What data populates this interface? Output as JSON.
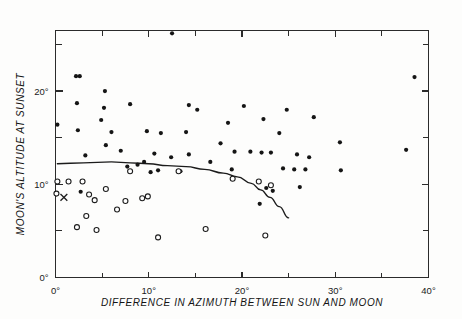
{
  "chart_data": {
    "type": "scatter",
    "title": "",
    "xlabel": "DIFFERENCE IN AZIMUTH BETWEEN SUN AND MOON",
    "ylabel": "MOON'S ALTITUDE AT SUNSET",
    "xlim": [
      0,
      40
    ],
    "ylim": [
      0,
      26.5
    ],
    "grid": false,
    "legend_position": "none",
    "x_major_ticks": [
      0,
      10,
      20,
      30,
      40
    ],
    "x_minor_ticks": [
      5,
      15,
      25,
      35
    ],
    "x_tick_labels": [
      "0°",
      "10°",
      "20°",
      "30°",
      "40°"
    ],
    "y_major_ticks": [
      0,
      10,
      20
    ],
    "y_minor_ticks": [
      5,
      15,
      25
    ],
    "y_tick_labels": [
      "0°",
      "10°",
      "20°"
    ],
    "x_unit": "degrees",
    "y_unit": "degrees",
    "series": [
      {
        "name": "filled-circles",
        "marker": "filled-circle",
        "color": "#151515",
        "points": [
          [
            12.5,
            26.2
          ],
          [
            2.2,
            21.6
          ],
          [
            2.6,
            21.6
          ],
          [
            38.5,
            21.5
          ],
          [
            5.3,
            20.0
          ],
          [
            2.3,
            18.7
          ],
          [
            8.0,
            18.6
          ],
          [
            5.2,
            18.2
          ],
          [
            14.3,
            18.5
          ],
          [
            15.2,
            18.0
          ],
          [
            20.2,
            18.4
          ],
          [
            0.2,
            16.4
          ],
          [
            24.8,
            18.0
          ],
          [
            4.9,
            16.9
          ],
          [
            22.3,
            17.0
          ],
          [
            27.7,
            17.2
          ],
          [
            18.5,
            16.6
          ],
          [
            2.4,
            15.8
          ],
          [
            9.8,
            15.7
          ],
          [
            6.0,
            15.6
          ],
          [
            14.0,
            15.6
          ],
          [
            11.3,
            15.5
          ],
          [
            24.0,
            15.5
          ],
          [
            5.4,
            14.2
          ],
          [
            17.7,
            14.4
          ],
          [
            30.5,
            14.5
          ],
          [
            37.6,
            13.7
          ],
          [
            7.0,
            13.6
          ],
          [
            19.2,
            13.5
          ],
          [
            10.6,
            13.3
          ],
          [
            14.3,
            13.2
          ],
          [
            3.2,
            13.1
          ],
          [
            20.9,
            13.5
          ],
          [
            22.1,
            13.4
          ],
          [
            23.1,
            13.4
          ],
          [
            25.9,
            13.2
          ],
          [
            12.4,
            12.9
          ],
          [
            27.2,
            12.9
          ],
          [
            9.5,
            12.4
          ],
          [
            16.6,
            12.4
          ],
          [
            8.8,
            12.1
          ],
          [
            7.7,
            11.9
          ],
          [
            24.4,
            11.7
          ],
          [
            25.6,
            11.6
          ],
          [
            26.8,
            11.6
          ],
          [
            30.6,
            11.5
          ],
          [
            11.0,
            11.5
          ],
          [
            18.9,
            11.6
          ],
          [
            2.7,
            9.2
          ],
          [
            22.6,
            9.6
          ],
          [
            23.3,
            9.3
          ],
          [
            26.2,
            9.7
          ],
          [
            21.9,
            7.9
          ],
          [
            13.4,
            11.4
          ],
          [
            10.2,
            11.3
          ]
        ]
      },
      {
        "name": "open-circles",
        "marker": "open-circle",
        "color": "#1d1d1d",
        "points": [
          [
            0.2,
            10.3
          ],
          [
            1.4,
            10.3
          ],
          [
            2.9,
            10.3
          ],
          [
            8.0,
            11.4
          ],
          [
            13.2,
            11.4
          ],
          [
            19.0,
            10.6
          ],
          [
            21.8,
            10.3
          ],
          [
            23.1,
            9.9
          ],
          [
            5.4,
            9.5
          ],
          [
            3.6,
            8.9
          ],
          [
            0.1,
            9.0
          ],
          [
            4.2,
            8.3
          ],
          [
            9.3,
            8.5
          ],
          [
            9.9,
            8.7
          ],
          [
            7.5,
            8.2
          ],
          [
            6.6,
            7.3
          ],
          [
            3.3,
            6.6
          ],
          [
            2.3,
            5.4
          ],
          [
            4.4,
            5.1
          ],
          [
            11.0,
            4.3
          ],
          [
            16.1,
            5.2
          ],
          [
            22.5,
            4.5
          ]
        ]
      },
      {
        "name": "x-marker",
        "marker": "x",
        "color": "#1d1d1d",
        "points": [
          [
            0.9,
            8.6
          ]
        ]
      }
    ],
    "curve": {
      "name": "fitted-boundary-curve",
      "points": [
        [
          0.2,
          12.2
        ],
        [
          3.0,
          12.3
        ],
        [
          6.0,
          12.4
        ],
        [
          8.0,
          12.3
        ],
        [
          10.0,
          12.2
        ],
        [
          12.0,
          12.0
        ],
        [
          14.0,
          11.9
        ],
        [
          16.0,
          11.6
        ],
        [
          18.0,
          11.2
        ],
        [
          19.5,
          10.8
        ],
        [
          21.0,
          10.1
        ],
        [
          22.0,
          9.4
        ],
        [
          23.0,
          8.6
        ],
        [
          24.0,
          7.6
        ],
        [
          25.0,
          6.4
        ]
      ]
    }
  },
  "figure": {
    "background_color": "#fdfdfc",
    "axis_color": "#2b2b2b",
    "marker_fill_color": "#151515",
    "marker_open_color": "#ffffff"
  }
}
